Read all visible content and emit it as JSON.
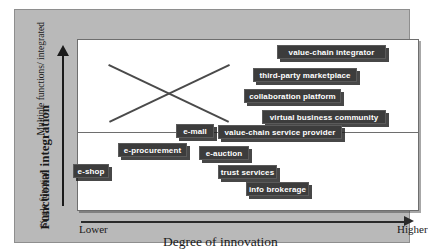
{
  "chart_data": {
    "type": "scatter",
    "title": "",
    "xlabel": "Degree of innovation",
    "ylabel": "Functional integration",
    "x_axis": {
      "label": "Degree of innovation",
      "low_tick": "Lower",
      "high_tick": "Higher",
      "direction": "arrow-right"
    },
    "y_axis": {
      "label": "Functional integration",
      "top_tick": "Multiple functions/ integrated",
      "bottom_tick": "Single function",
      "direction": "arrow-up"
    },
    "grid": false,
    "legend": "none",
    "annotations": [
      {
        "name": "crossing-line-descending",
        "x1": 93,
        "y1": 53,
        "x2": 213,
        "y2": 110
      },
      {
        "name": "crossing-line-ascending",
        "x1": 93,
        "y1": 110,
        "x2": 213,
        "y2": 53
      },
      {
        "name": "horizontal-divider",
        "y": 122
      }
    ],
    "points": [
      {
        "label": "value-chain integrator",
        "x": 0.8,
        "y": 0.9,
        "left": 277,
        "top": 45,
        "width": 109
      },
      {
        "label": "third-party marketplace",
        "x": 0.71,
        "y": 0.77,
        "left": 253,
        "top": 68,
        "width": 104
      },
      {
        "label": "collaboration platform",
        "x": 0.66,
        "y": 0.66,
        "left": 244,
        "top": 89,
        "width": 97
      },
      {
        "label": "virtual business community",
        "x": 0.74,
        "y": 0.54,
        "left": 262,
        "top": 110,
        "width": 124
      },
      {
        "label": "value-chain service provider",
        "x": 0.62,
        "y": 0.44,
        "left": 218,
        "top": 125,
        "width": 124
      },
      {
        "label": "e-mall",
        "x": 0.36,
        "y": 0.44,
        "left": 176,
        "top": 124,
        "width": 38
      },
      {
        "label": "e-procurement",
        "x": 0.21,
        "y": 0.33,
        "left": 118,
        "top": 143,
        "width": 69
      },
      {
        "label": "e-auction",
        "x": 0.44,
        "y": 0.33,
        "left": 199,
        "top": 146,
        "width": 50
      },
      {
        "label": "e-shop",
        "x": 0.06,
        "y": 0.22,
        "left": 73,
        "top": 164,
        "width": 36
      },
      {
        "label": "trust services",
        "x": 0.5,
        "y": 0.18,
        "left": 218,
        "top": 165,
        "width": 59
      },
      {
        "label": "info brokerage",
        "x": 0.58,
        "y": 0.1,
        "left": 246,
        "top": 182,
        "width": 63
      }
    ]
  },
  "colors": {
    "panel_background": "#b9b9b9",
    "plot_background": "#ffffff",
    "node_fill": "#3c3c3c",
    "node_text": "#ffffff",
    "axis": "#1a1a1a",
    "line": "#4a4a4a"
  }
}
